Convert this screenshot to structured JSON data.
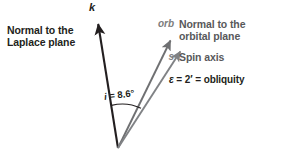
{
  "figure": {
    "width": 283,
    "height": 158,
    "background": "#ffffff"
  },
  "colors": {
    "k_line": "#231f20",
    "orb_line": "#6f7072",
    "spin_line": "#808285",
    "arc": "#231f20",
    "dark_text": "#231f20",
    "gray_text": "#58595b",
    "symbol_gray": "#7d7d7d"
  },
  "labels": {
    "laplace": {
      "line1": "Normal to the",
      "line2": "Laplace plane"
    },
    "k_axis": "k",
    "inclination": {
      "symbol": "i",
      "equals": " = ",
      "value": "8.6°",
      "full": "i = 8.6°"
    },
    "obliquity": {
      "symbol": "ε",
      "expression": " = 2′ = obliquity",
      "full": "ε = 2′ = obliquity"
    }
  },
  "legend": {
    "orb": {
      "symbol": "orb",
      "line1": "Normal to the",
      "line2": "orbital plane"
    },
    "spin": {
      "symbol": "s",
      "line1": "Spin axis"
    }
  },
  "geometry": {
    "vertex": {
      "x": 118,
      "y": 148
    },
    "k_tip": {
      "x": 97,
      "y": 18
    },
    "orb_tip": {
      "x": 174,
      "y": 36
    },
    "spin_tip": {
      "x": 184,
      "y": 47
    },
    "arc_radius": 43
  }
}
